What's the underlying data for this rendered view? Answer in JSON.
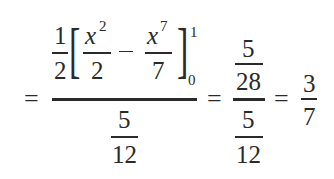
{
  "expression": {
    "latex": "= \\frac{\\frac{1}{2}\\left[\\frac{x^2}{2} - \\frac{x^7}{7}\\right]_0^1}{\\frac{5}{12}} = \\frac{\\frac{5}{28}}{\\frac{5}{12}} = \\frac{3}{7}",
    "equals": "=",
    "minus": "−",
    "left_bracket": "[",
    "right_bracket": "]",
    "numerator": {
      "coef_num": "1",
      "coef_den": "2",
      "term1": {
        "var": "x",
        "exp": "2",
        "den": "2"
      },
      "term2": {
        "var": "x",
        "exp": "7",
        "den": "7"
      },
      "upper_limit": "1",
      "lower_limit": "0"
    },
    "denominator": {
      "num": "5",
      "den": "12"
    },
    "step2": {
      "num": {
        "num": "5",
        "den": "28"
      },
      "den": {
        "num": "5",
        "den": "12"
      }
    },
    "result": {
      "num": "3",
      "den": "7"
    }
  },
  "colors": {
    "ink": "#2a2a2a",
    "background": "#ffffff"
  }
}
